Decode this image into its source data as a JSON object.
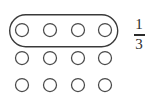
{
  "figure": {
    "background_color": "#ffffff",
    "width": 156,
    "height": 111,
    "stroke_color": "#4a4a4a",
    "group_stroke_color": "#3a3a3a",
    "text_color": "#2b2b2b"
  },
  "array": {
    "rows": 3,
    "columns": 4,
    "total_counters": 12,
    "counter_shape": "circle",
    "counter_radius": 6.5,
    "column_centers": [
      22,
      50,
      78,
      105
    ],
    "row_centers": [
      30,
      58,
      85
    ],
    "counters": [
      {
        "row": 1,
        "col": 1,
        "cx": 22,
        "cy": 30,
        "grouped": true
      },
      {
        "row": 1,
        "col": 2,
        "cx": 50,
        "cy": 30,
        "grouped": true
      },
      {
        "row": 1,
        "col": 3,
        "cx": 78,
        "cy": 30,
        "grouped": true
      },
      {
        "row": 1,
        "col": 4,
        "cx": 105,
        "cy": 30,
        "grouped": true
      },
      {
        "row": 2,
        "col": 1,
        "cx": 22,
        "cy": 58,
        "grouped": false
      },
      {
        "row": 2,
        "col": 2,
        "cx": 50,
        "cy": 58,
        "grouped": false
      },
      {
        "row": 2,
        "col": 3,
        "cx": 78,
        "cy": 58,
        "grouped": false
      },
      {
        "row": 2,
        "col": 4,
        "cx": 105,
        "cy": 58,
        "grouped": false
      },
      {
        "row": 3,
        "col": 1,
        "cx": 22,
        "cy": 85,
        "grouped": false
      },
      {
        "row": 3,
        "col": 2,
        "cx": 50,
        "cy": 85,
        "grouped": false
      },
      {
        "row": 3,
        "col": 3,
        "cx": 78,
        "cy": 85,
        "grouped": false
      },
      {
        "row": 3,
        "col": 4,
        "cx": 105,
        "cy": 85,
        "grouped": false
      }
    ]
  },
  "group_ring": {
    "shape": "pill",
    "encircles_row": 1,
    "encircled_count": 4,
    "x": 9,
    "y": 14,
    "width": 109,
    "height": 33,
    "corner_radius": 16.5
  },
  "fraction": {
    "numerator": "1",
    "denominator": "3",
    "display": "1/3",
    "x": 128,
    "y": 16,
    "width": 22,
    "height": 38
  }
}
